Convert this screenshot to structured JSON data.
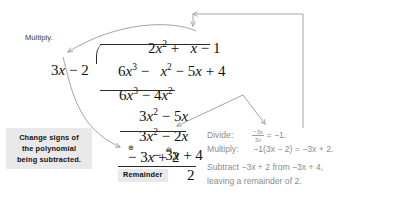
{
  "figure": {
    "type": "polynomial-long-division",
    "dividend": "6x^3 - x^2 - 5x + 4",
    "divisor": "3x - 2",
    "quotient": "2x^2 + x - 1",
    "remainder": "2"
  },
  "labels": {
    "multiply": "Multiply.",
    "remainder_tag": "Remainder",
    "callout_line1": "Change signs of",
    "callout_line2": "the polynomial",
    "callout_line3": "being subtracted."
  },
  "quotient_line": {
    "term1_coeff": "2",
    "term1_var": "x",
    "term1_exp": "2",
    "op1": "+",
    "term2_var": "x",
    "op2": "−",
    "term3": "1"
  },
  "divisor_line": {
    "divisor_coeff": "3",
    "divisor_var": "x",
    "divisor_op": "−",
    "divisor_const": "2",
    "dividend_t1_coeff": "6",
    "dividend_t1_var": "x",
    "dividend_t1_exp": "3",
    "dividend_op1": "−",
    "dividend_t2_var": "x",
    "dividend_t2_exp": "2",
    "dividend_op2": "−",
    "dividend_t3_coeff": "5",
    "dividend_t3_var": "x",
    "dividend_op3": "+",
    "dividend_t4": "4"
  },
  "work_lines": [
    {
      "name": "step1-product",
      "text": "6x³ − 4x²"
    },
    {
      "name": "step1-difference",
      "text": "3x² − 5x"
    },
    {
      "name": "step2-product",
      "text": "3x² − 2x"
    },
    {
      "name": "step2-difference",
      "text": "− 3x + 4"
    },
    {
      "name": "step3-product-signs-changed",
      "text": "− 3x + 2"
    },
    {
      "name": "final-remainder",
      "text": "2"
    }
  ],
  "signs": {
    "plus_circle": "⊕",
    "minus_circle": "⊖",
    "plus_glyph": "+",
    "minus_glyph": "−"
  },
  "explanations": [
    {
      "name": "divide",
      "keyword": "Divide:",
      "fraction_numerator": "−3x",
      "fraction_denominator": "3x",
      "equals": "=",
      "result": "−1."
    },
    {
      "name": "multiply",
      "keyword": "Multiply:",
      "expression": "−1(3x − 2) = −3x + 2."
    },
    {
      "name": "subtract",
      "keyword": "Subtract",
      "line1": "Subtract −3x + 2 from −3x + 4,",
      "line2": "leaving a remainder of 2."
    }
  ],
  "colors": {
    "ink": "#111111",
    "explain_text": "#8d8d8d",
    "callout_bg": "#e9e9e9",
    "arrow": "#9a9a9a",
    "rule": "#2b2b2b"
  }
}
